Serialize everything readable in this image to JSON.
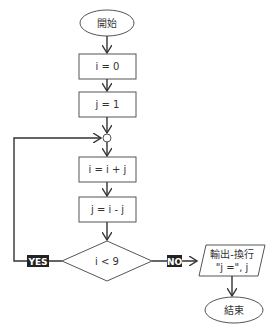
{
  "diagram": {
    "type": "flowchart",
    "colors": {
      "stroke": "#555555",
      "line": "#333333",
      "text": "#333333",
      "label_bg": "#222222",
      "label_text": "#ffffff",
      "background": "#ffffff"
    },
    "nodes": {
      "start": {
        "shape": "ellipse",
        "text": "開始"
      },
      "init_i": {
        "shape": "rect",
        "text": "i = 0"
      },
      "init_j": {
        "shape": "rect",
        "text": "j = 1"
      },
      "junction": {
        "shape": "circle",
        "text": ""
      },
      "update_i": {
        "shape": "rect",
        "text": "i = i + j"
      },
      "update_j": {
        "shape": "rect",
        "text": "j = i - j"
      },
      "condition": {
        "shape": "diamond",
        "text": "i < 9"
      },
      "output": {
        "shape": "parallelogram",
        "line1": "輸出-換行",
        "line2": "\"j =\", j"
      },
      "end": {
        "shape": "ellipse",
        "text": "結束"
      }
    },
    "edges": [
      {
        "from": "start",
        "to": "init_i"
      },
      {
        "from": "init_i",
        "to": "init_j"
      },
      {
        "from": "init_j",
        "to": "junction"
      },
      {
        "from": "junction",
        "to": "update_i"
      },
      {
        "from": "update_i",
        "to": "update_j"
      },
      {
        "from": "update_j",
        "to": "condition"
      },
      {
        "from": "condition",
        "to": "junction",
        "label": "YES"
      },
      {
        "from": "condition",
        "to": "output",
        "label": "NO"
      },
      {
        "from": "output",
        "to": "end"
      }
    ],
    "labels": {
      "yes": "YES",
      "no": "NO"
    }
  }
}
